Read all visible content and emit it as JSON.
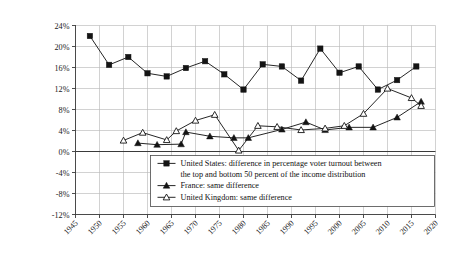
{
  "chart_data": {
    "type": "line",
    "title": "",
    "xlabel": "",
    "ylabel": "",
    "xlim": [
      1945,
      2020
    ],
    "ylim": [
      -12,
      24
    ],
    "grid": true,
    "legend_position": "inside-bottom-center",
    "x_ticks": [
      "1945",
      "1950",
      "1955",
      "1960",
      "1965",
      "1970",
      "1975",
      "1980",
      "1985",
      "1990",
      "1995",
      "2000",
      "2005",
      "2010",
      "2015",
      "2020"
    ],
    "y_ticks": [
      "24%",
      "20%",
      "16%",
      "12%",
      "8%",
      "4%",
      "0%",
      "-4%",
      "-8%",
      "-12%"
    ],
    "series": [
      {
        "name": "United States: difference in percentage voter turnout between the top and bottom 50 percent of the income distribution",
        "short_name": "United States",
        "marker": "filled-square",
        "points": [
          {
            "x": 1948,
            "y": 22.0
          },
          {
            "x": 1952,
            "y": 16.5
          },
          {
            "x": 1956,
            "y": 18.0
          },
          {
            "x": 1960,
            "y": 14.9
          },
          {
            "x": 1964,
            "y": 14.3
          },
          {
            "x": 1968,
            "y": 15.9
          },
          {
            "x": 1972,
            "y": 17.2
          },
          {
            "x": 1976,
            "y": 14.7
          },
          {
            "x": 1980,
            "y": 11.8
          },
          {
            "x": 1984,
            "y": 16.6
          },
          {
            "x": 1988,
            "y": 16.2
          },
          {
            "x": 1992,
            "y": 13.5
          },
          {
            "x": 1996,
            "y": 19.6
          },
          {
            "x": 2000,
            "y": 15.0
          },
          {
            "x": 2004,
            "y": 16.2
          },
          {
            "x": 2008,
            "y": 11.8
          },
          {
            "x": 2012,
            "y": 13.6
          },
          {
            "x": 2016,
            "y": 16.2
          }
        ]
      },
      {
        "name": "France: same difference",
        "short_name": "France",
        "marker": "filled-triangle",
        "points": [
          {
            "x": 1958,
            "y": 1.6
          },
          {
            "x": 1962,
            "y": 1.3
          },
          {
            "x": 1967,
            "y": 1.4
          },
          {
            "x": 1968,
            "y": 3.7
          },
          {
            "x": 1973,
            "y": 2.9
          },
          {
            "x": 1978,
            "y": 2.6
          },
          {
            "x": 1981,
            "y": 2.6
          },
          {
            "x": 1988,
            "y": 4.2
          },
          {
            "x": 1993,
            "y": 5.6
          },
          {
            "x": 1997,
            "y": 4.1
          },
          {
            "x": 2002,
            "y": 4.6
          },
          {
            "x": 2007,
            "y": 4.6
          },
          {
            "x": 2012,
            "y": 6.5
          },
          {
            "x": 2017,
            "y": 9.5
          }
        ]
      },
      {
        "name": "United Kingdom: same difference",
        "short_name": "United Kingdom",
        "marker": "open-triangle",
        "points": [
          {
            "x": 1955,
            "y": 2.1
          },
          {
            "x": 1959,
            "y": 3.6
          },
          {
            "x": 1964,
            "y": 2.2
          },
          {
            "x": 1966,
            "y": 3.9
          },
          {
            "x": 1970,
            "y": 5.9
          },
          {
            "x": 1974,
            "y": 7.0
          },
          {
            "x": 1979,
            "y": 0.2
          },
          {
            "x": 1983,
            "y": 4.9
          },
          {
            "x": 1987,
            "y": 4.7
          },
          {
            "x": 1992,
            "y": 4.1
          },
          {
            "x": 1997,
            "y": 4.4
          },
          {
            "x": 2001,
            "y": 4.9
          },
          {
            "x": 2005,
            "y": 7.2
          },
          {
            "x": 2010,
            "y": 12.0
          },
          {
            "x": 2015,
            "y": 10.2
          },
          {
            "x": 2017,
            "y": 8.7
          }
        ]
      }
    ],
    "legend_entries": [
      {
        "marker": "filled-square",
        "lines": [
          "United States: difference in percentage voter turnout between",
          "the top and bottom 50 percent of the income distribution"
        ]
      },
      {
        "marker": "filled-triangle",
        "lines": [
          "France: same difference"
        ]
      },
      {
        "marker": "open-triangle",
        "lines": [
          "United Kingdom: same difference"
        ]
      }
    ],
    "colors": {
      "line": "#1a1a1a",
      "grid": "#b9b9b9",
      "axis": "#3a3a3a",
      "background": "#ffffff"
    }
  }
}
